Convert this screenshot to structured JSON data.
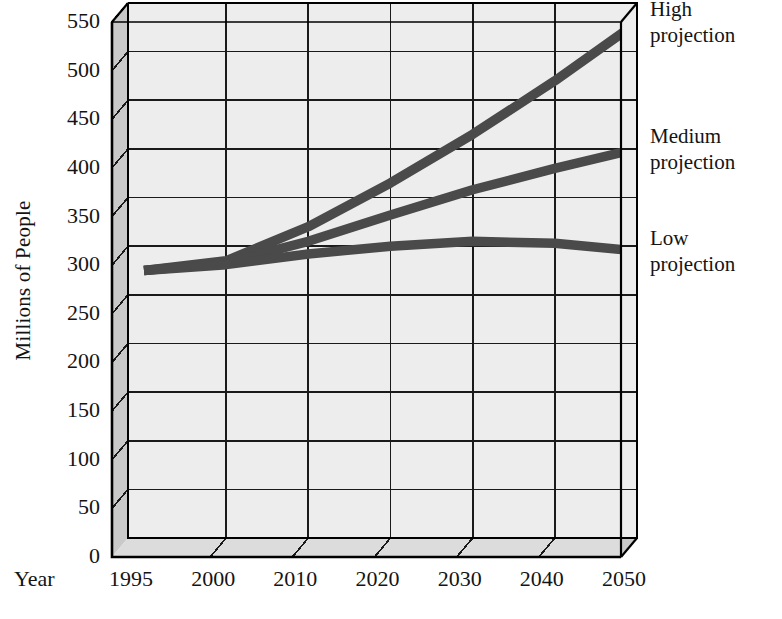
{
  "chart_data": {
    "type": "line",
    "title": "",
    "xlabel": "Year",
    "ylabel": "Millions of People",
    "ylim": [
      0,
      550
    ],
    "grid": true,
    "legend_position": "right",
    "style": "3d-box",
    "x_axis_name": "Year",
    "categories": [
      "1995",
      "2000",
      "2010",
      "2020",
      "2030",
      "2040",
      "2050"
    ],
    "y_ticks": [
      "0",
      "50",
      "100",
      "150",
      "200",
      "250",
      "300",
      "350",
      "400",
      "450",
      "500",
      "550"
    ],
    "series": [
      {
        "name": "High projection",
        "legend_line_1": "High",
        "legend_line_2": "projection",
        "color": "#4a4a4a",
        "values": [
          275,
          285,
          320,
          365,
          415,
          470,
          530
        ]
      },
      {
        "name": "Medium projection",
        "legend_line_1": "Medium",
        "legend_line_2": "projection",
        "color": "#4a4a4a",
        "values": [
          275,
          283,
          305,
          332,
          358,
          380,
          400
        ]
      },
      {
        "name": "Low projection",
        "legend_line_1": "Low",
        "legend_line_2": "projection",
        "color": "#4a4a4a",
        "values": [
          275,
          281,
          292,
          300,
          305,
          303,
          295
        ]
      }
    ]
  },
  "axis": {
    "y_title": "Millions of People",
    "x_title": "Year"
  },
  "colors": {
    "line": "#4a4a4a",
    "plot_background": "#ededed",
    "wall_shade": "#c9c9c9",
    "floor_shade": "#dcdcdc",
    "top_shade": "#e4e4e4",
    "gridline": "#1a1a1a",
    "frame": "#000000"
  }
}
